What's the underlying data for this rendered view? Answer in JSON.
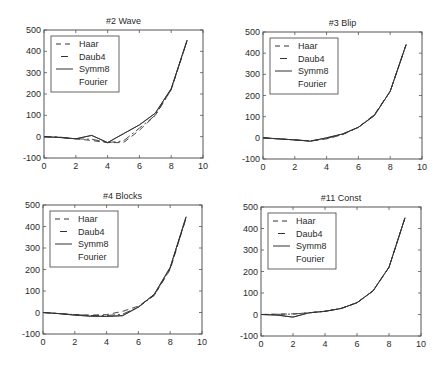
{
  "figure": {
    "background": "#ffffff",
    "line_color": "#333333",
    "axis_color": "#555555"
  },
  "legend_entries": [
    {
      "label": "Haar",
      "style": "dashed"
    },
    {
      "label": "Daub4",
      "style": "dashdot"
    },
    {
      "label": "Symm8",
      "style": "solid"
    },
    {
      "label": "Fourier",
      "style": "none"
    }
  ],
  "chart_data": [
    {
      "type": "line",
      "title": "#2 Wave",
      "xlabel": "",
      "ylabel": "",
      "xlim": [
        0,
        10
      ],
      "ylim": [
        -100,
        500
      ],
      "xticks": [
        0,
        2,
        4,
        6,
        8,
        10
      ],
      "yticks": [
        -100,
        0,
        100,
        200,
        300,
        400,
        500
      ],
      "grid": false,
      "legend": [
        "Haar",
        "Daub4",
        "Symm8",
        "Fourier"
      ],
      "legend_position": "upper left",
      "x": [
        0,
        1,
        2,
        3,
        4,
        5,
        6,
        7,
        8,
        9
      ],
      "series": [
        {
          "name": "Haar",
          "values": [
            0,
            -3,
            -10,
            -18,
            -28,
            -28,
            30,
            100,
            220,
            450
          ]
        },
        {
          "name": "Daub4",
          "values": [
            0,
            -2,
            -10,
            -12,
            -28,
            -20,
            40,
            100,
            220,
            450
          ]
        },
        {
          "name": "Symm8",
          "values": [
            0,
            -4,
            -10,
            6,
            -28,
            14,
            55,
            110,
            225,
            452
          ]
        },
        {
          "name": "Fourier",
          "values": [
            0,
            -4,
            -10,
            6,
            -28,
            14,
            55,
            110,
            225,
            452
          ]
        }
      ]
    },
    {
      "type": "line",
      "title": "#3 Blip",
      "xlabel": "",
      "ylabel": "",
      "xlim": [
        0,
        10
      ],
      "ylim": [
        -100,
        500
      ],
      "xticks": [
        0,
        2,
        4,
        6,
        8,
        10
      ],
      "yticks": [
        -100,
        0,
        100,
        200,
        300,
        400,
        500
      ],
      "grid": false,
      "legend": [
        "Haar",
        "Daub4",
        "Symm8",
        "Fourier"
      ],
      "legend_position": "upper left",
      "x": [
        0,
        1,
        2,
        3,
        4,
        5,
        6,
        7,
        8,
        9
      ],
      "series": [
        {
          "name": "Haar",
          "values": [
            0,
            -5,
            -10,
            -15,
            -5,
            15,
            50,
            110,
            220,
            440
          ]
        },
        {
          "name": "Daub4",
          "values": [
            0,
            -5,
            -10,
            -14,
            -3,
            16,
            50,
            108,
            220,
            440
          ]
        },
        {
          "name": "Symm8",
          "values": [
            0,
            -5,
            -10,
            -16,
            0,
            18,
            50,
            105,
            220,
            440
          ]
        },
        {
          "name": "Fourier",
          "values": [
            0,
            -5,
            -10,
            -16,
            0,
            18,
            50,
            105,
            220,
            440
          ]
        }
      ]
    },
    {
      "type": "line",
      "title": "#4 Blocks",
      "xlabel": "",
      "ylabel": "",
      "xlim": [
        0,
        10
      ],
      "ylim": [
        -100,
        500
      ],
      "xticks": [
        0,
        2,
        4,
        6,
        8,
        10
      ],
      "yticks": [
        -100,
        0,
        100,
        200,
        300,
        400,
        500
      ],
      "grid": false,
      "legend": [
        "Haar",
        "Daub4",
        "Symm8",
        "Fourier"
      ],
      "legend_position": "upper left",
      "x": [
        0,
        1,
        2,
        3,
        4,
        5,
        6,
        7,
        8,
        9
      ],
      "series": [
        {
          "name": "Haar",
          "values": [
            0,
            -5,
            -10,
            -12,
            -10,
            5,
            30,
            80,
            200,
            440
          ]
        },
        {
          "name": "Daub4",
          "values": [
            0,
            -5,
            -10,
            -14,
            -14,
            -8,
            25,
            80,
            205,
            440
          ]
        },
        {
          "name": "Symm8",
          "values": [
            0,
            -5,
            -12,
            -17,
            -18,
            -15,
            25,
            85,
            210,
            445
          ]
        },
        {
          "name": "Fourier",
          "values": [
            0,
            -5,
            -12,
            -17,
            -18,
            -15,
            25,
            85,
            210,
            445
          ]
        }
      ]
    },
    {
      "type": "line",
      "title": "#11 Const",
      "xlabel": "",
      "ylabel": "",
      "xlim": [
        0,
        10
      ],
      "ylim": [
        -100,
        500
      ],
      "xticks": [
        0,
        2,
        4,
        6,
        8,
        10
      ],
      "yticks": [
        -100,
        0,
        100,
        200,
        300,
        400,
        500
      ],
      "grid": false,
      "legend": [
        "Haar",
        "Daub4",
        "Symm8",
        "Fourier"
      ],
      "legend_position": "upper left",
      "x": [
        0,
        1,
        2,
        3,
        4,
        5,
        6,
        7,
        8,
        9
      ],
      "series": [
        {
          "name": "Haar",
          "values": [
            0,
            2,
            3,
            8,
            15,
            28,
            55,
            110,
            220,
            450
          ]
        },
        {
          "name": "Daub4",
          "values": [
            0,
            1,
            2,
            8,
            15,
            28,
            55,
            110,
            220,
            450
          ]
        },
        {
          "name": "Symm8",
          "values": [
            0,
            -3,
            -12,
            8,
            15,
            28,
            55,
            110,
            220,
            450
          ]
        },
        {
          "name": "Fourier",
          "values": [
            0,
            -3,
            -12,
            8,
            15,
            28,
            55,
            110,
            220,
            450
          ]
        }
      ]
    }
  ]
}
